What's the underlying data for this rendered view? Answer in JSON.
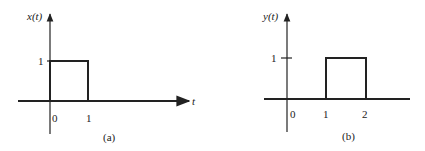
{
  "figures": [
    {
      "id": "a",
      "caption": "(a)",
      "y_label": "x(t)",
      "x_label": "t",
      "y_tick": "1",
      "x_ticks": [
        "0",
        "1"
      ],
      "signal": {
        "type": "rectangular-pulse",
        "start": 0,
        "end": 1,
        "amplitude": 1
      }
    },
    {
      "id": "b",
      "caption": "(b)",
      "y_label": "y(t)",
      "x_label": "",
      "y_tick": "1",
      "x_ticks": [
        "0",
        "1",
        "2"
      ],
      "signal": {
        "type": "rectangular-pulse",
        "start": 1,
        "end": 2,
        "amplitude": 1
      }
    }
  ],
  "colors": {
    "ink": "#222222",
    "background": "#ffffff"
  }
}
